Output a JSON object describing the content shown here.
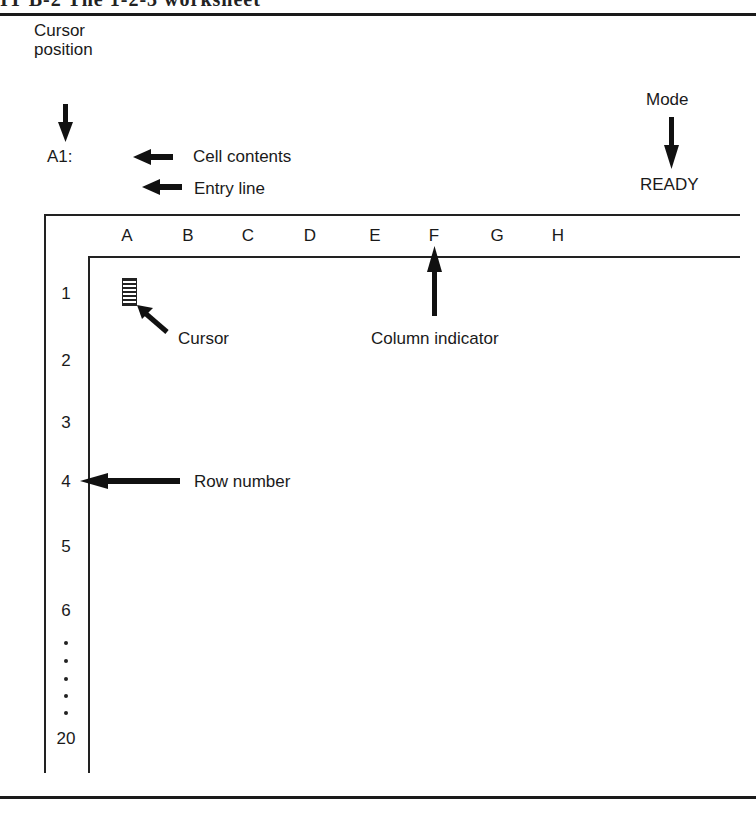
{
  "header": {
    "title_fragment": "IT B-2  The 1-2-3 worksheet"
  },
  "annotations": {
    "cursor_position": [
      "Cursor",
      "position"
    ],
    "cell_address": "A1:",
    "cell_contents": "Cell contents",
    "entry_line": "Entry line",
    "mode": "Mode",
    "mode_value": "READY",
    "cursor": "Cursor",
    "column_indicator": "Column indicator",
    "row_number": "Row number"
  },
  "worksheet": {
    "columns": [
      "A",
      "B",
      "C",
      "D",
      "E",
      "F",
      "G",
      "H"
    ],
    "rows": [
      "1",
      "2",
      "3",
      "4",
      "5",
      "6",
      "20"
    ],
    "ellipsis_dots": 5
  },
  "colors": {
    "ink": "#1a1a1a",
    "background": "#ffffff"
  }
}
